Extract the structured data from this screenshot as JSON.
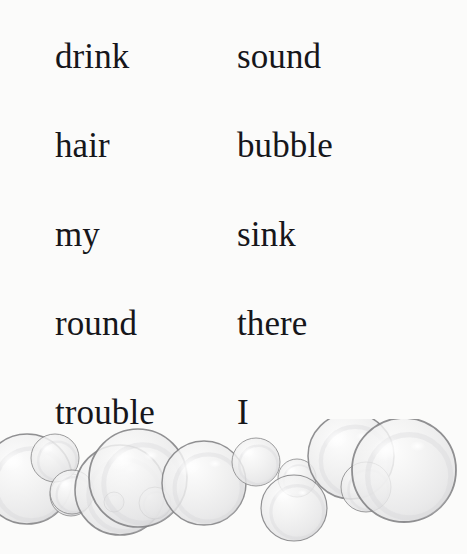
{
  "page": {
    "background_color": "#fbfbfa",
    "text_color": "#16161a"
  },
  "word_list": {
    "columns": 2,
    "rows": [
      {
        "left": "drink",
        "right": "sound"
      },
      {
        "left": "hair",
        "right": "bubble"
      },
      {
        "left": "my",
        "right": "sink"
      },
      {
        "left": "round",
        "right": "there"
      },
      {
        "left": "trouble",
        "right": "I"
      }
    ]
  },
  "illustration": {
    "name": "soap-bubbles-border",
    "stroke_color": "#7e7e80",
    "fill_color": "#efefef",
    "highlight_color": "#fafafa",
    "bubbles": [
      {
        "cx": 27,
        "cy": 479,
        "r": 45
      },
      {
        "cx": 71,
        "cy": 495,
        "r": 21
      },
      {
        "cx": 55,
        "cy": 458,
        "r": 24
      },
      {
        "cx": 72,
        "cy": 492,
        "r": 22
      },
      {
        "cx": 120,
        "cy": 490,
        "r": 45
      },
      {
        "cx": 114,
        "cy": 502,
        "r": 10
      },
      {
        "cx": 155,
        "cy": 503,
        "r": 16
      },
      {
        "cx": 138,
        "cy": 478,
        "r": 49
      },
      {
        "cx": 204,
        "cy": 483,
        "r": 42
      },
      {
        "cx": 256,
        "cy": 462,
        "r": 24
      },
      {
        "cx": 297,
        "cy": 478,
        "r": 19
      },
      {
        "cx": 294,
        "cy": 508,
        "r": 33
      },
      {
        "cx": 351,
        "cy": 456,
        "r": 43
      },
      {
        "cx": 366,
        "cy": 487,
        "r": 25
      },
      {
        "cx": 404,
        "cy": 470,
        "r": 52
      }
    ]
  }
}
